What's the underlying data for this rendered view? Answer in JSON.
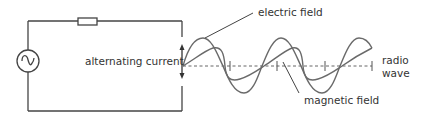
{
  "labels": {
    "alternating_current": "alternating current",
    "electric_field": "electric field",
    "magnetic_field": "magnetic field",
    "radio_wave_line1": "radio",
    "radio_wave_line2": "wave"
  },
  "components": {
    "source": "ac-source-icon",
    "resistor": "resistor"
  },
  "colors": {
    "line": "#444444",
    "wave": "#6a6a6a",
    "axis": "#666666",
    "text": "#333333"
  }
}
